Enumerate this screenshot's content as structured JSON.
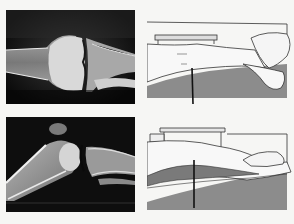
{
  "figure": {
    "layout": "2x2 grid",
    "panels": [
      {
        "id": "xray-knee-ap",
        "kind": "radiograph",
        "description": "Knee joint radiograph, extended, anteroposterior/frontal view"
      },
      {
        "id": "positioning-extended",
        "kind": "line-illustration",
        "description": "Leg extended on table with plate above the knee, vertical central ray line at knee"
      },
      {
        "id": "xray-knee-lateral",
        "kind": "radiograph",
        "description": "Knee joint radiograph, lateral view with slight flexion"
      },
      {
        "id": "positioning-lateral",
        "kind": "line-illustration",
        "description": "Patient lying on side, leg on table with plate above, vertical central ray line at knee"
      }
    ]
  },
  "colors": {
    "background": "#f6f6f4",
    "xray_dark": "#0c0c0c",
    "bone_light": "#e8e8e8",
    "table_gray": "#8a8a8a",
    "line": "#222222"
  }
}
